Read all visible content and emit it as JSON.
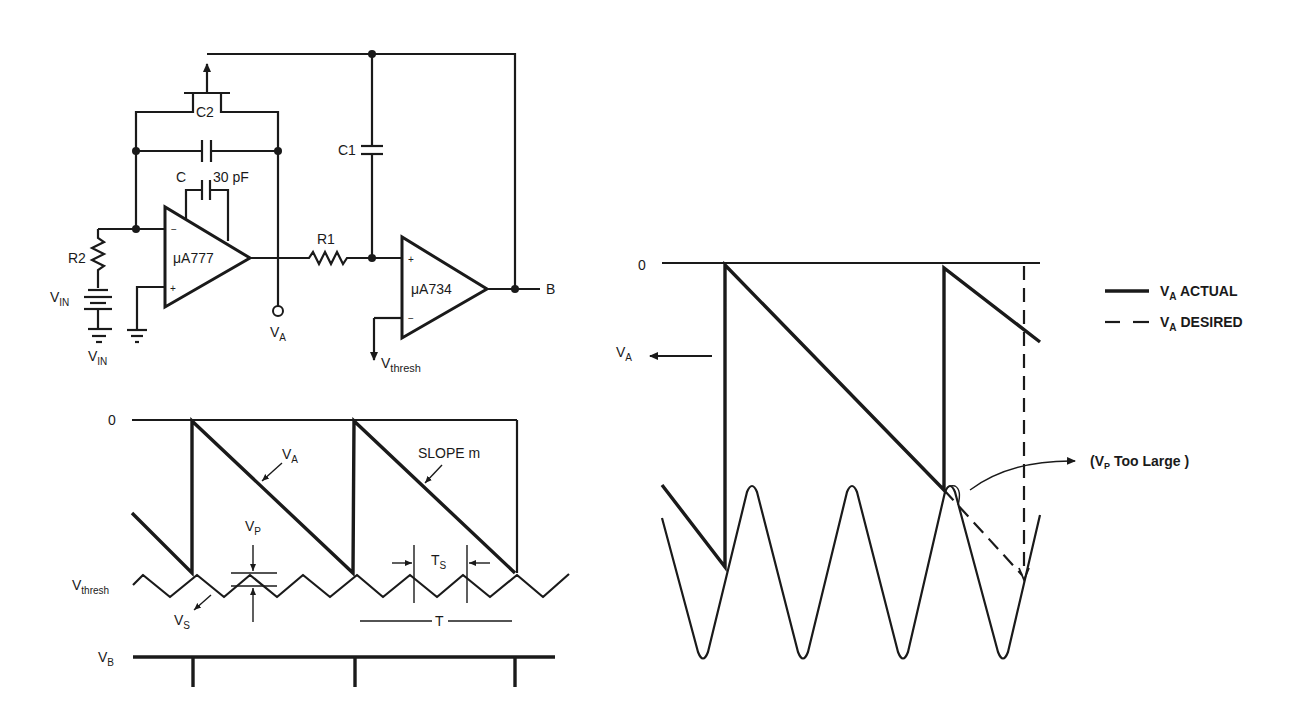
{
  "circuit": {
    "opamp1": {
      "label": "μA777",
      "minus": "−",
      "plus": "+"
    },
    "opamp2": {
      "label": "μA734",
      "minus": "−",
      "plus": "+"
    },
    "c2": "C2",
    "c1": "C1",
    "c": "C",
    "c_value": "30 pF",
    "r1": "R1",
    "r2": "R2",
    "vin_battery": "V",
    "vin_battery_sub": "IN",
    "vin_ground": "V",
    "vin_ground_sub": "IN",
    "va": "V",
    "va_sub": "A",
    "vthresh": "V",
    "vthresh_sub": "thresh",
    "output_b": "B"
  },
  "left_timing": {
    "zero": "0",
    "va": "V",
    "va_sub": "A",
    "slope": "SLOPE m",
    "vp": "V",
    "vp_sub": "P",
    "vthresh": "V",
    "vthresh_sub": "thresh",
    "vs": "V",
    "vs_sub": "S",
    "ts": "T",
    "ts_sub": "S",
    "t": "T",
    "vb": "V",
    "vb_sub": "B"
  },
  "right_timing": {
    "zero": "0",
    "va": "V",
    "va_sub": "A",
    "annotation_open": "(V",
    "annotation_sub": "P",
    "annotation_rest": " Too Large )"
  },
  "legend": {
    "items": [
      {
        "style": "solid",
        "label_main": "V",
        "label_sub": "A",
        "label_rest": " ACTUAL"
      },
      {
        "style": "dashed",
        "label_main": "V",
        "label_sub": "A",
        "label_rest": " DESIRED"
      }
    ]
  },
  "colors": {
    "ink": "#1a1a1a",
    "background": "#ffffff"
  }
}
